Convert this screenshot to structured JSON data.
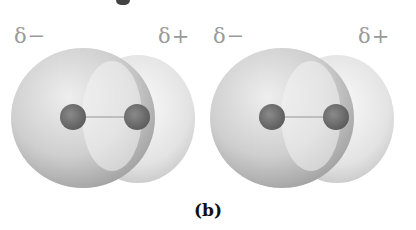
{
  "figure": {
    "caption": "(b)",
    "molecules": [
      {
        "negative_label": "δ−",
        "positive_label": "δ+"
      },
      {
        "negative_label": "δ−",
        "positive_label": "δ+"
      }
    ],
    "colors": {
      "label": "#9a9a9a",
      "cloud_light": "#f2f2f2",
      "cloud_dark": "#a8a8a8",
      "atom": "#6e6e6e",
      "bond": "#b0b0b0",
      "caption": "#111111"
    }
  }
}
